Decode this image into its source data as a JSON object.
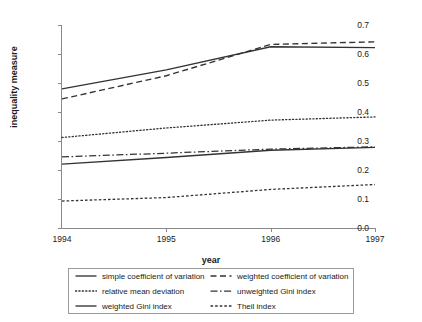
{
  "chart_data": {
    "type": "line",
    "title": "",
    "xlabel": "year",
    "ylabel": "inequality measure",
    "x": [
      1994,
      1995,
      1996,
      1997
    ],
    "xtick_labels": [
      "1994",
      "1995",
      "1996",
      "1997"
    ],
    "ytick_labels": [
      "0.0",
      "0.1",
      "0.2",
      "0.3",
      "0.4",
      "0.5",
      "0.6",
      "0.7"
    ],
    "ytick_values": [
      0.0,
      0.1,
      0.2,
      0.3,
      0.4,
      0.5,
      0.6,
      0.7
    ],
    "xlim": [
      1994,
      1997
    ],
    "ylim": [
      0.0,
      0.7
    ],
    "grid": false,
    "legend_position": "bottom",
    "series": [
      {
        "name": "simple coefficient of variation",
        "style": "solid",
        "values": [
          0.48,
          0.545,
          0.625,
          0.622
        ]
      },
      {
        "name": "weighted coefficient of variation",
        "style": "dashed",
        "values": [
          0.445,
          0.525,
          0.633,
          0.642
        ]
      },
      {
        "name": "relative mean deviation",
        "style": "dotted",
        "values": [
          0.312,
          0.345,
          0.372,
          0.383
        ]
      },
      {
        "name": "unweighted Gini index",
        "style": "dashdot",
        "values": [
          0.245,
          0.258,
          0.272,
          0.28
        ]
      },
      {
        "name": "weighted Gini index",
        "style": "solid",
        "values": [
          0.22,
          0.243,
          0.268,
          0.278
        ]
      },
      {
        "name": "Theil index",
        "style": "finedash",
        "values": [
          0.093,
          0.105,
          0.133,
          0.15
        ]
      }
    ],
    "colors": {
      "line": "#333333",
      "axis": "#8a8a8a",
      "text": "#1a1a1a",
      "background": "#ffffff"
    }
  },
  "legend": {
    "entries": [
      {
        "label": "simple coefficient of variation",
        "style": "solid"
      },
      {
        "label": "weighted coefficient of variation",
        "style": "dashed"
      },
      {
        "label": "relative mean deviation",
        "style": "dotted"
      },
      {
        "label": "unweighted Gini index",
        "style": "dashdot"
      },
      {
        "label": "weighted Gini index",
        "style": "solid"
      },
      {
        "label": "Theil index",
        "style": "finedash"
      }
    ]
  }
}
